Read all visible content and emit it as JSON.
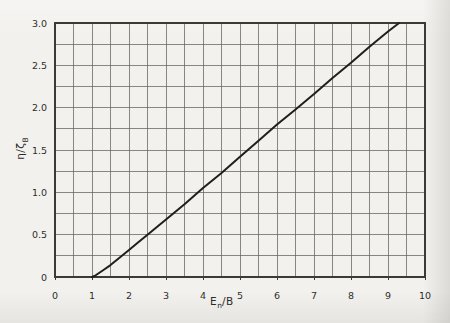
{
  "figure": {
    "background_color": "#f2f1ee",
    "grid_color": "#63625e",
    "border_color": "#3a3a38",
    "curve_color": "#1f1f1d",
    "text_color": "#2e2e2c"
  },
  "labels": {
    "xlabel_base": "E",
    "xlabel_sub": "n",
    "xlabel_rest": "/B",
    "ylabel_base": "η/ζ",
    "ylabel_sub": "B"
  },
  "chart_data": {
    "type": "line",
    "title": "",
    "xlabel": "E_n/B",
    "ylabel": "η/ζ_B",
    "xlim": [
      0,
      10
    ],
    "ylim": [
      0,
      3.0
    ],
    "grid": "on",
    "x_minor_step": 0.5,
    "y_minor_step": 0.25,
    "x_major_ticks": [
      0,
      1,
      2,
      3,
      4,
      5,
      6,
      7,
      8,
      9,
      10
    ],
    "x_tick_labels": [
      "0",
      "1",
      "2",
      "3",
      "4",
      "5",
      "6",
      "7",
      "8",
      "9",
      "10"
    ],
    "y_major_ticks": [
      0,
      0.5,
      1.0,
      1.5,
      2.0,
      2.5,
      3.0
    ],
    "y_tick_labels": [
      "0",
      "0.5",
      "1.0",
      "1.5",
      "2.0",
      "2.5",
      "3.0"
    ],
    "legend": "none",
    "series": [
      {
        "name": "eta-over-zetaB-curve",
        "points": [
          [
            1.0,
            0.0
          ],
          [
            1.1,
            0.02
          ],
          [
            1.3,
            0.08
          ],
          [
            1.5,
            0.14
          ],
          [
            1.75,
            0.23
          ],
          [
            2.0,
            0.32
          ],
          [
            2.25,
            0.41
          ],
          [
            2.5,
            0.5
          ],
          [
            3.0,
            0.68
          ],
          [
            3.5,
            0.86
          ],
          [
            4.0,
            1.05
          ],
          [
            4.5,
            1.23
          ],
          [
            5.0,
            1.42
          ],
          [
            5.5,
            1.61
          ],
          [
            6.0,
            1.8
          ],
          [
            6.5,
            1.98
          ],
          [
            7.0,
            2.16
          ],
          [
            7.5,
            2.35
          ],
          [
            8.0,
            2.53
          ],
          [
            8.5,
            2.72
          ],
          [
            9.0,
            2.9
          ],
          [
            9.3,
            3.0
          ]
        ]
      }
    ]
  }
}
